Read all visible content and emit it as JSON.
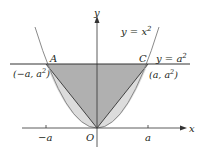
{
  "diagram": {
    "curve_label": "y = x",
    "curve_exponent": "2",
    "line_label": "y = a",
    "line_exponent": "2",
    "axis_x_label": "x",
    "axis_y_label": "y",
    "origin_label": "O",
    "point_A": "A",
    "point_C": "C",
    "coord_A_prefix": "(−a, a",
    "coord_A_exponent": "2",
    "coord_A_suffix": ")",
    "coord_C_prefix": "(a, a",
    "coord_C_exponent": "2",
    "coord_C_suffix": ")",
    "tick_neg": "−a",
    "tick_pos": "a",
    "colors": {
      "triangle_fill": "#b0b0b0",
      "parabola_region_fill": "#dcdcdc",
      "parabola_stroke": "#8a8a8a",
      "line_stroke": "#333333",
      "axis_stroke": "#333333"
    }
  }
}
